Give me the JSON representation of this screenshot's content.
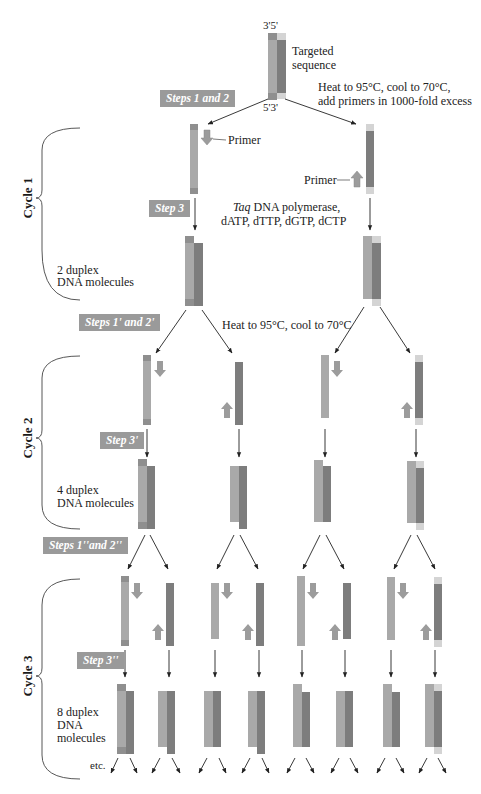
{
  "figure": {
    "top_molecule": {
      "label_top": "3'5'",
      "label_bottom": "5'3'",
      "caption": "Targeted\nsequence"
    },
    "steps": {
      "s12": "Steps 1 and 2",
      "s3": "Step 3",
      "s12p": "Steps 1' and 2'",
      "s3p": "Step 3'",
      "s12pp": "Steps 1''and 2''",
      "s3pp": "Step 3''"
    },
    "annotations": {
      "heat_primers_line1": "Heat to 95°C, cool to 70°C,",
      "heat_primers_line2": "add primers in 1000-fold excess",
      "primer_left": "Primer",
      "primer_right": "Primer",
      "taq_italic": "Taq",
      "taq_rest": " DNA polymerase,",
      "dntps": "dATP, dTTP, dGTP, dCTP",
      "heat2": "Heat to 95°C, cool to 70°C",
      "etc": "etc."
    },
    "cycles": [
      {
        "label": "Cycle 1",
        "result_line1": "2 duplex",
        "result_line2": "DNA molecules"
      },
      {
        "label": "Cycle 2",
        "result_line1": "4 duplex",
        "result_line2": "DNA molecules"
      },
      {
        "label": "Cycle 3",
        "result_line1": "8 duplex",
        "result_line2": "DNA",
        "result_line3": "molecules"
      }
    ],
    "colors": {
      "light_strand": "#a9a9a9",
      "dark_strand": "#7d7d7d",
      "end_light": "#d4d4d4",
      "end_dark": "#8f8f8f",
      "primer": "#9c9c9c",
      "step_box": "#9a9a9a",
      "arrow": "#222222"
    }
  }
}
